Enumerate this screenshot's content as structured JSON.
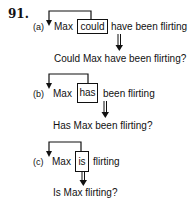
{
  "example_number": "91.",
  "items": [
    {
      "label": "(a)",
      "subject": "Max",
      "aux": "could",
      "rest": "have been flirting",
      "result": "Could Max have been flirting?"
    },
    {
      "label": "(b)",
      "subject": "Max",
      "aux": "has",
      "rest": "been flirting",
      "result": "Has Max been flirting?"
    },
    {
      "label": "(c)",
      "subject": "Max",
      "aux": "is",
      "rest": "flirting",
      "result": "Is Max flirting?"
    }
  ],
  "icons": {
    "movement_arrow": "bent-arrow-icon",
    "derivation_arrow": "double-down-arrow-icon"
  }
}
